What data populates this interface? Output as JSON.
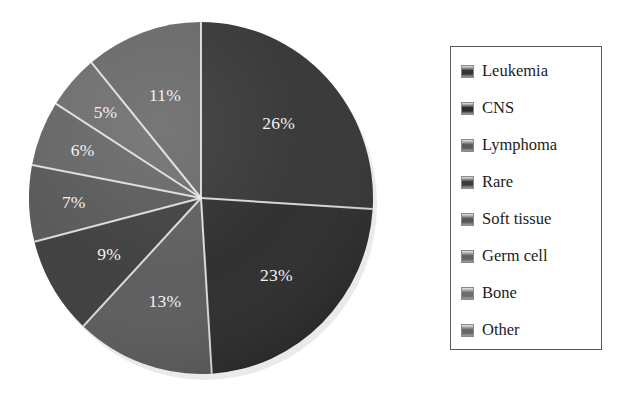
{
  "chart_data": {
    "type": "pie",
    "title": "",
    "subtitle": "",
    "xlabel": "",
    "ylabel": "",
    "legend_position": "right",
    "grid": false,
    "start_angle_deg": 0,
    "direction": "clockwise",
    "labels_show_percent": true,
    "categories": [
      "Leukemia",
      "CNS",
      "Lymphoma",
      "Rare",
      "Soft tissue",
      "Germ cell",
      "Bone",
      "Other"
    ],
    "values": [
      26,
      23,
      13,
      9,
      7,
      6,
      5,
      11
    ],
    "data_labels": [
      "26%",
      "23%",
      "13%",
      "9%",
      "7%",
      "6%",
      "5%",
      "11%"
    ],
    "slice_colors": [
      "#343434",
      "#2b2b2b",
      "#5b5b5b",
      "#3c3c3c",
      "#565656",
      "#636363",
      "#6b6b6b",
      "#666666"
    ],
    "separator_color": "#f0f0f0",
    "label_color": "#f2f2f2",
    "slices": [
      {
        "label": "Leukemia",
        "percent": 26,
        "display": "26%",
        "color": "#343434"
      },
      {
        "label": "CNS",
        "percent": 23,
        "display": "23%",
        "color": "#2b2b2b"
      },
      {
        "label": "Lymphoma",
        "percent": 13,
        "display": "13%",
        "color": "#5b5b5b"
      },
      {
        "label": "Rare",
        "percent": 9,
        "display": "9%",
        "color": "#3c3c3c"
      },
      {
        "label": "Soft tissue",
        "percent": 7,
        "display": "7%",
        "color": "#565656"
      },
      {
        "label": "Germ cell",
        "percent": 6,
        "display": "6%",
        "color": "#636363"
      },
      {
        "label": "Bone",
        "percent": 5,
        "display": "5%",
        "color": "#6b6b6b"
      },
      {
        "label": "Other",
        "percent": 11,
        "display": "11%",
        "color": "#666666"
      }
    ]
  },
  "legend": {
    "border_color": "#595959",
    "items": [
      {
        "label": "Leukemia",
        "color": "#343434"
      },
      {
        "label": "CNS",
        "color": "#2b2b2b"
      },
      {
        "label": "Lymphoma",
        "color": "#5b5b5b"
      },
      {
        "label": "Rare",
        "color": "#3c3c3c"
      },
      {
        "label": "Soft tissue",
        "color": "#565656"
      },
      {
        "label": "Germ cell",
        "color": "#636363"
      },
      {
        "label": "Bone",
        "color": "#6b6b6b"
      },
      {
        "label": "Other",
        "color": "#666666"
      }
    ]
  },
  "slice_labels": {
    "s0": "26%",
    "s1": "23%",
    "s2": "13%",
    "s3": "9%",
    "s4": "7%",
    "s5": "6%",
    "s6": "5%",
    "s7": "11%"
  }
}
